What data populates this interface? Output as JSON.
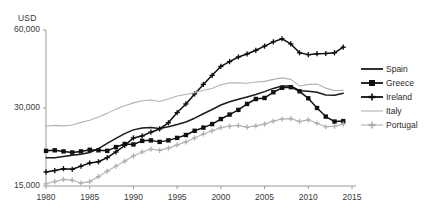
{
  "chart_data": {
    "type": "line",
    "title": "",
    "xlabel": "",
    "ylabel": "USD",
    "y_unit_label": "USD",
    "yscale": "log",
    "ylim": [
      15000,
      60000
    ],
    "xlim": [
      1980,
      2015
    ],
    "grid": false,
    "y_ticks": [
      15000,
      30000,
      60000
    ],
    "y_tick_labels": [
      "15,000",
      "30,000",
      "60,000"
    ],
    "x_ticks": [
      1980,
      1985,
      1990,
      1995,
      2000,
      2005,
      2010,
      2015
    ],
    "x_tick_labels": [
      "1980",
      "1985",
      "1990",
      "1995",
      "2000",
      "2005",
      "2010",
      "2015"
    ],
    "legend_position": "right",
    "x": [
      1980,
      1981,
      1982,
      1983,
      1984,
      1985,
      1986,
      1987,
      1988,
      1989,
      1990,
      1991,
      1992,
      1993,
      1994,
      1995,
      1996,
      1997,
      1998,
      1999,
      2000,
      2001,
      2002,
      2003,
      2004,
      2005,
      2006,
      2007,
      2008,
      2009,
      2010,
      2011,
      2012,
      2013,
      2014
    ],
    "series": [
      {
        "name": "Spain",
        "color": "#1a1a1a",
        "style": "solid-thick",
        "marker": "none",
        "values": [
          19300,
          19300,
          19500,
          19700,
          19900,
          20200,
          20900,
          21900,
          22900,
          23900,
          24700,
          25100,
          25200,
          25000,
          25400,
          25900,
          26500,
          27400,
          28500,
          29600,
          30800,
          31700,
          32400,
          33100,
          33800,
          34700,
          35700,
          36500,
          36500,
          35000,
          34800,
          34500,
          33700,
          33600,
          34200
        ]
      },
      {
        "name": "Greece",
        "color": "#111111",
        "style": "solid-thick",
        "marker": "square",
        "values": [
          20500,
          20600,
          20400,
          20200,
          20400,
          20700,
          20600,
          20500,
          21200,
          21800,
          21700,
          22400,
          22500,
          22200,
          22500,
          23000,
          23600,
          24500,
          25200,
          26000,
          27200,
          28300,
          29500,
          31100,
          32500,
          32800,
          34500,
          35900,
          36100,
          34800,
          32700,
          30000,
          27800,
          26600,
          26700
        ]
      },
      {
        "name": "Ireland",
        "color": "#0d0d0d",
        "style": "solid-thick",
        "marker": "plus",
        "values": [
          17000,
          17200,
          17500,
          17400,
          17900,
          18400,
          18600,
          19300,
          20300,
          21500,
          23000,
          23400,
          24200,
          24900,
          26300,
          28800,
          31100,
          34000,
          37000,
          40100,
          43400,
          45300,
          47200,
          48500,
          50100,
          52000,
          54000,
          55500,
          53000,
          49000,
          48200,
          48600,
          48700,
          49000,
          51500
        ]
      },
      {
        "name": "Italy",
        "color": "#b3b3b3",
        "style": "solid-thin",
        "marker": "none",
        "values": [
          25500,
          25700,
          25600,
          25800,
          26400,
          26900,
          27700,
          28600,
          29700,
          30600,
          31400,
          32000,
          32200,
          31800,
          32500,
          33400,
          33800,
          34400,
          35100,
          35700,
          36900,
          37500,
          37500,
          37400,
          37800,
          38000,
          38700,
          39200,
          38700,
          36500,
          37000,
          37100,
          35800,
          35000,
          35100
        ]
      },
      {
        "name": "Portugal",
        "color": "#b0b0b0",
        "style": "solid-thin",
        "marker": "plus",
        "values": [
          15300,
          15600,
          15900,
          15800,
          15400,
          15600,
          16300,
          17100,
          17900,
          18700,
          19600,
          20300,
          20800,
          20600,
          21000,
          21600,
          22200,
          23000,
          23800,
          24500,
          25200,
          25500,
          25700,
          25300,
          25600,
          26000,
          26700,
          27200,
          27300,
          26600,
          27000,
          26200,
          25400,
          25500,
          26000
        ]
      }
    ]
  }
}
